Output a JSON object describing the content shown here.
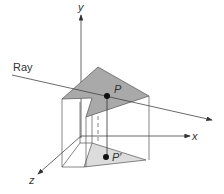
{
  "diagram": {
    "labels": {
      "ray": "Ray",
      "x_axis": "x",
      "y_axis": "y",
      "z_axis": "z",
      "point": "P",
      "projected_point": "P′"
    },
    "colors": {
      "top_triangle": "#a9a9a9",
      "bottom_triangle": "#dcdcdc",
      "lines": "#444444",
      "points": "#111111"
    }
  }
}
